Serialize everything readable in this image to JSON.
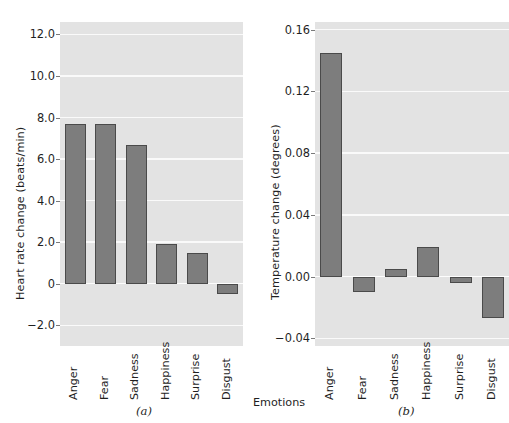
{
  "figure": {
    "xaxis_title": "Emotions"
  },
  "chart_data": [
    {
      "type": "bar",
      "panel": "(a)",
      "title": "",
      "xlabel": "",
      "ylabel": "Heart rate change (beats/min)",
      "categories": [
        "Anger",
        "Fear",
        "Sadness",
        "Happiness",
        "Surprise",
        "Disgust"
      ],
      "values": [
        7.7,
        7.7,
        6.7,
        1.9,
        1.5,
        -0.5
      ],
      "yticks": [
        "12.0",
        "10.0",
        "8.0",
        "6.0",
        "4.0",
        "2.0",
        "0",
        "-2.0"
      ],
      "ytick_values": [
        12.0,
        10.0,
        8.0,
        6.0,
        4.0,
        2.0,
        0,
        -2.0
      ],
      "ylim": [
        -3.0,
        12.6
      ],
      "grid": true,
      "legend": "none",
      "bar_color": "#7d7d7d",
      "plot_bg": "#e3e3e3"
    },
    {
      "type": "bar",
      "panel": "(b)",
      "title": "",
      "xlabel": "Emotions",
      "ylabel": "Temperature change (degrees)",
      "categories": [
        "Anger",
        "Fear",
        "Sadness",
        "Happiness",
        "Surprise",
        "Disgust"
      ],
      "values": [
        0.145,
        -0.01,
        0.005,
        0.019,
        -0.004,
        -0.027
      ],
      "yticks": [
        "0.16",
        "0.12",
        "0.08",
        "0.04",
        "0.00",
        "-0.04"
      ],
      "ytick_values": [
        0.16,
        0.12,
        0.08,
        0.04,
        0.0,
        -0.04
      ],
      "ylim": [
        -0.045,
        0.165
      ],
      "grid": true,
      "legend": "none",
      "bar_color": "#7d7d7d",
      "plot_bg": "#e3e3e3"
    }
  ]
}
